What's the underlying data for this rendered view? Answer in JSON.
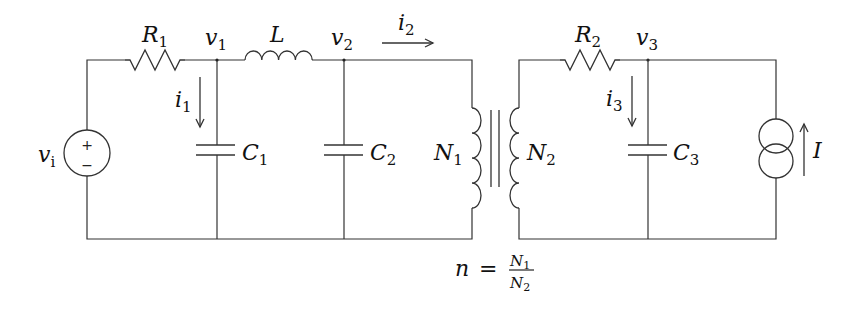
{
  "diagram": {
    "type": "circuit-schematic",
    "components": {
      "source_voltage": {
        "symbol": "v",
        "subscript": "i",
        "plus": "+",
        "minus": "−"
      },
      "R1": {
        "symbol": "R",
        "subscript": "1"
      },
      "L": {
        "symbol": "L",
        "subscript": ""
      },
      "C1": {
        "symbol": "C",
        "subscript": "1"
      },
      "C2": {
        "symbol": "C",
        "subscript": "2"
      },
      "N1": {
        "symbol": "N",
        "subscript": "1"
      },
      "N2": {
        "symbol": "N",
        "subscript": "2"
      },
      "R2": {
        "symbol": "R",
        "subscript": "2"
      },
      "C3": {
        "symbol": "C",
        "subscript": "3"
      },
      "source_current": {
        "symbol": "I",
        "subscript": ""
      }
    },
    "nodes": {
      "v1": {
        "symbol": "v",
        "subscript": "1"
      },
      "v2": {
        "symbol": "v",
        "subscript": "2"
      },
      "v3": {
        "symbol": "v",
        "subscript": "3"
      }
    },
    "currents": {
      "i1": {
        "symbol": "i",
        "subscript": "1",
        "direction": "down"
      },
      "i2": {
        "symbol": "i",
        "subscript": "2",
        "direction": "right"
      },
      "i3": {
        "symbol": "i",
        "subscript": "3",
        "direction": "down"
      }
    },
    "equation": {
      "lhs": "n",
      "equals": "=",
      "numerator": {
        "symbol": "N",
        "subscript": "1"
      },
      "denominator": {
        "symbol": "N",
        "subscript": "2"
      }
    },
    "colors": {
      "line": "#333333",
      "text": "#111111",
      "background": "#ffffff"
    }
  }
}
